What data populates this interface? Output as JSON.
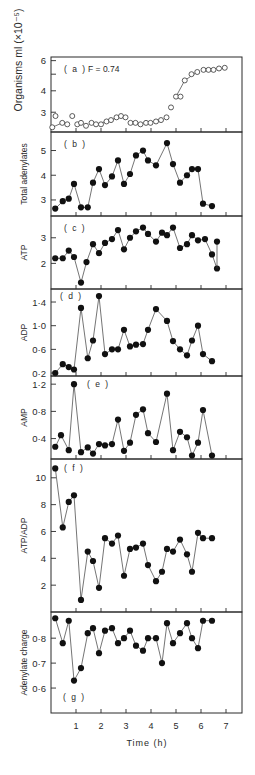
{
  "figure": {
    "xlabel": "Time (h)",
    "x_ticks": [
      "1",
      "2",
      "3",
      "4",
      "5",
      "6",
      "7"
    ]
  },
  "chart_data": [
    {
      "id": "a",
      "type": "scatter",
      "panel_label": "(a)",
      "annotation": "F = 0.74",
      "ylabel": "Organisms ml (×10⁻⁵)",
      "yscale": "log",
      "ylim": [
        2.3,
        6.3
      ],
      "y_ticks": [
        {
          "v": 6,
          "label": "6"
        },
        {
          "v": 5,
          "label": ""
        },
        {
          "v": 4,
          "label": "4"
        },
        {
          "v": 3,
          "label": "3"
        }
      ],
      "marker": "open",
      "x": [
        0.05,
        0.18,
        0.45,
        0.65,
        0.85,
        1.05,
        1.2,
        1.4,
        1.62,
        1.8,
        2.0,
        2.22,
        2.4,
        2.62,
        2.8,
        2.98,
        3.18,
        3.38,
        3.58,
        3.8,
        3.98,
        4.2,
        4.4,
        4.62,
        4.8,
        5.0,
        5.18,
        5.35,
        5.62,
        5.85,
        6.1,
        6.3,
        6.5,
        6.72,
        6.95
      ],
      "values": [
        2.45,
        2.85,
        2.6,
        2.55,
        2.85,
        2.55,
        2.6,
        2.5,
        2.6,
        2.55,
        2.55,
        2.65,
        2.7,
        2.8,
        2.85,
        2.8,
        2.6,
        2.6,
        2.55,
        2.6,
        2.6,
        2.65,
        2.7,
        2.8,
        3.2,
        3.7,
        3.7,
        4.6,
        5.0,
        5.15,
        5.3,
        5.3,
        5.3,
        5.4,
        5.45
      ],
      "line_segments": [
        [
          0,
          2
        ],
        [
          9,
          12
        ],
        [
          12,
          14
        ],
        [
          25,
          27
        ],
        [
          27,
          29
        ]
      ]
    },
    {
      "id": "b",
      "type": "line",
      "panel_label": "(b)",
      "ylabel": "Total adenylates",
      "yscale": "linear",
      "ylim": [
        2.35,
        5.75
      ],
      "y_ticks": [
        {
          "v": 5,
          "label": "5"
        },
        {
          "v": 4,
          "label": "4"
        },
        {
          "v": 3,
          "label": "3"
        }
      ],
      "marker": "filled",
      "x": [
        0.17,
        0.47,
        0.71,
        0.92,
        1.2,
        1.47,
        1.68,
        1.92,
        2.16,
        2.44,
        2.68,
        2.92,
        3.16,
        3.4,
        3.68,
        3.88,
        4.2,
        4.64,
        4.88,
        5.16,
        5.44,
        5.64,
        5.88,
        6.08,
        6.44
      ],
      "values": [
        2.65,
        2.95,
        3.05,
        3.65,
        2.7,
        2.7,
        3.7,
        4.25,
        3.6,
        3.95,
        4.6,
        3.65,
        4.05,
        4.8,
        5.0,
        4.6,
        4.4,
        5.3,
        4.45,
        3.7,
        4.0,
        4.25,
        4.25,
        2.85,
        2.75
      ]
    },
    {
      "id": "c",
      "type": "line",
      "panel_label": "(c)",
      "ylabel": "ATP",
      "yscale": "linear",
      "ylim": [
        1.0,
        3.85
      ],
      "y_ticks": [
        {
          "v": 3,
          "label": "3"
        },
        {
          "v": 2,
          "label": "2"
        }
      ],
      "marker": "filled",
      "x": [
        0.17,
        0.47,
        0.71,
        0.92,
        1.2,
        1.42,
        1.68,
        1.92,
        2.16,
        2.44,
        2.68,
        2.92,
        3.16,
        3.4,
        3.68,
        3.88,
        4.2,
        4.44,
        4.64,
        4.88,
        5.16,
        5.44,
        5.64,
        5.88,
        6.16,
        6.44,
        6.64
      ],
      "values": [
        2.2,
        2.2,
        2.5,
        2.25,
        1.25,
        2.05,
        2.75,
        2.4,
        2.8,
        2.95,
        3.3,
        2.55,
        3.0,
        3.25,
        3.4,
        3.15,
        2.85,
        3.2,
        3.1,
        3.4,
        2.6,
        2.75,
        3.1,
        2.9,
        2.95,
        2.35,
        1.8
      ],
      "extra_point": {
        "x": 6.64,
        "value": 2.85
      }
    },
    {
      "id": "d",
      "type": "line",
      "panel_label": "(d)",
      "ylabel": "ADP",
      "yscale": "linear",
      "ylim": [
        0.15,
        1.62
      ],
      "y_ticks": [
        {
          "v": 1.4,
          "label": "1·4"
        },
        {
          "v": 1.0,
          "label": "1·0"
        },
        {
          "v": 0.6,
          "label": "0·6"
        },
        {
          "v": 0.2,
          "label": "0·2"
        }
      ],
      "marker": "filled",
      "x": [
        0.17,
        0.47,
        0.71,
        0.92,
        1.2,
        1.47,
        1.68,
        1.92,
        2.16,
        2.44,
        2.68,
        2.92,
        3.16,
        3.4,
        3.68,
        3.88,
        4.2,
        4.64,
        4.88,
        5.16,
        5.44,
        5.64,
        5.88,
        6.08,
        6.44
      ],
      "values": [
        0.2,
        0.35,
        0.3,
        0.26,
        1.3,
        0.45,
        0.75,
        1.5,
        0.52,
        0.6,
        0.6,
        0.93,
        0.65,
        0.68,
        0.69,
        0.93,
        1.28,
        1.08,
        0.74,
        0.6,
        0.5,
        0.75,
        1.0,
        0.52,
        0.4
      ]
    },
    {
      "id": "e",
      "type": "line",
      "panel_label": "(e)",
      "ylabel": "AMP",
      "yscale": "linear",
      "ylim": [
        0.1,
        1.32
      ],
      "y_ticks": [
        {
          "v": 1.2,
          "label": "1·2"
        },
        {
          "v": 0.8,
          "label": "0·8"
        },
        {
          "v": 0.4,
          "label": "0·4"
        }
      ],
      "marker": "filled",
      "x": [
        0.17,
        0.4,
        0.71,
        0.92,
        1.2,
        1.47,
        1.68,
        1.92,
        2.16,
        2.44,
        2.68,
        2.92,
        3.16,
        3.4,
        3.68,
        3.88,
        4.2,
        4.64,
        4.88,
        5.16,
        5.44,
        5.64,
        5.88,
        6.08,
        6.44
      ],
      "values": [
        0.28,
        0.45,
        0.23,
        1.2,
        0.2,
        0.27,
        0.18,
        0.32,
        0.3,
        0.32,
        0.68,
        0.22,
        0.34,
        0.75,
        0.83,
        0.48,
        0.35,
        1.06,
        0.23,
        0.5,
        0.42,
        0.15,
        0.34,
        0.82,
        0.15
      ]
    },
    {
      "id": "f",
      "type": "line",
      "panel_label": "(f)",
      "ylabel": "ATP/ADP",
      "yscale": "linear",
      "ylim": [
        0.0,
        11.4
      ],
      "y_ticks": [
        {
          "v": 10,
          "label": "10"
        },
        {
          "v": 8,
          "label": "8"
        },
        {
          "v": 6,
          "label": "6"
        },
        {
          "v": 4,
          "label": "4"
        },
        {
          "v": 2,
          "label": "2"
        }
      ],
      "marker": "filled",
      "x": [
        0.17,
        0.47,
        0.71,
        0.92,
        1.2,
        1.47,
        1.68,
        1.92,
        2.16,
        2.44,
        2.68,
        2.92,
        3.16,
        3.4,
        3.68,
        3.88,
        4.2,
        4.44,
        4.64,
        4.88,
        5.16,
        5.44,
        5.64,
        5.88,
        6.08,
        6.44
      ],
      "values": [
        10.7,
        6.3,
        8.2,
        8.7,
        0.9,
        4.5,
        3.8,
        1.8,
        5.5,
        5.1,
        5.7,
        2.7,
        4.7,
        4.8,
        5.1,
        3.5,
        2.3,
        3.0,
        4.7,
        4.5,
        5.4,
        4.3,
        3.0,
        5.9,
        5.5,
        5.5
      ]
    },
    {
      "id": "g",
      "type": "line",
      "panel_label": "(g)",
      "ylabel": "Adenylate charge",
      "yscale": "linear",
      "ylim": [
        0.5,
        0.905
      ],
      "y_ticks": [
        {
          "v": 0.8,
          "label": "0·8"
        },
        {
          "v": 0.7,
          "label": "0·7"
        },
        {
          "v": 0.6,
          "label": "0·6"
        }
      ],
      "marker": "filled",
      "x": [
        0.17,
        0.47,
        0.71,
        0.92,
        1.2,
        1.47,
        1.68,
        1.92,
        2.16,
        2.44,
        2.68,
        2.92,
        3.16,
        3.4,
        3.68,
        3.88,
        4.2,
        4.44,
        4.64,
        4.88,
        5.16,
        5.44,
        5.64,
        5.88,
        6.08,
        6.44
      ],
      "values": [
        0.88,
        0.78,
        0.87,
        0.63,
        0.68,
        0.82,
        0.84,
        0.74,
        0.83,
        0.84,
        0.78,
        0.8,
        0.83,
        0.77,
        0.75,
        0.8,
        0.8,
        0.7,
        0.86,
        0.78,
        0.82,
        0.86,
        0.8,
        0.76,
        0.87,
        0.87
      ]
    }
  ]
}
